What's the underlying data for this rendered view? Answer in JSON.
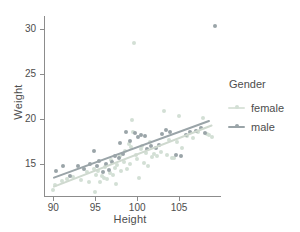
{
  "chart_data": {
    "type": "scatter",
    "title": "",
    "xlabel": "Height",
    "ylabel": "Weight",
    "xlim": [
      89.0,
      110.0
    ],
    "ylim": [
      11.4,
      31.5
    ],
    "xticks": [
      90,
      95,
      100,
      105
    ],
    "yticks": [
      15,
      20,
      25,
      30
    ],
    "xtick_labels": [
      "90",
      "95",
      "100",
      "105"
    ],
    "ytick_labels": [
      "15",
      "20",
      "25",
      "30"
    ],
    "grid": false,
    "legend": {
      "title": "Gender",
      "position": "right",
      "entries": [
        {
          "label": "female",
          "color": "#d3dfd5"
        },
        {
          "label": "male",
          "color": "#9aa4a8"
        }
      ]
    },
    "series": [
      {
        "name": "female",
        "color": "#d3dfd5",
        "fit_line": {
          "x": [
            89.9,
            108.9
          ],
          "y": [
            12.55,
            19.45
          ],
          "color": "#cfd9cf"
        },
        "points": [
          [
            89.9,
            12.1
          ],
          [
            90.2,
            12.6
          ],
          [
            91.0,
            13.1
          ],
          [
            91.6,
            13.3
          ],
          [
            92.4,
            13.5
          ],
          [
            93.3,
            13.2
          ],
          [
            94.0,
            14.1
          ],
          [
            94.3,
            13.0
          ],
          [
            94.8,
            14.4
          ],
          [
            95.0,
            11.9
          ],
          [
            95.1,
            13.8
          ],
          [
            95.3,
            14.2
          ],
          [
            95.6,
            13.0
          ],
          [
            95.8,
            13.6
          ],
          [
            96.0,
            13.4
          ],
          [
            96.2,
            14.6
          ],
          [
            96.4,
            13.3
          ],
          [
            96.7,
            14.0
          ],
          [
            96.9,
            15.4
          ],
          [
            97.1,
            13.7
          ],
          [
            97.3,
            14.5
          ],
          [
            97.5,
            12.7
          ],
          [
            97.6,
            14.9
          ],
          [
            97.9,
            15.9
          ],
          [
            98.1,
            14.2
          ],
          [
            98.4,
            15.2
          ],
          [
            98.6,
            16.4
          ],
          [
            98.8,
            14.4
          ],
          [
            99.0,
            17.2
          ],
          [
            99.2,
            15.0
          ],
          [
            99.3,
            16.9
          ],
          [
            99.4,
            19.9
          ],
          [
            99.5,
            18.5
          ],
          [
            99.6,
            28.5
          ],
          [
            99.8,
            16.0
          ],
          [
            100.0,
            15.5
          ],
          [
            100.2,
            13.4
          ],
          [
            100.4,
            16.6
          ],
          [
            100.6,
            17.0
          ],
          [
            100.8,
            15.1
          ],
          [
            101.0,
            16.2
          ],
          [
            101.3,
            14.8
          ],
          [
            101.5,
            17.4
          ],
          [
            101.8,
            15.7
          ],
          [
            102.0,
            16.1
          ],
          [
            102.4,
            15.9
          ],
          [
            102.8,
            16.3
          ],
          [
            103.2,
            20.9
          ],
          [
            103.5,
            16.0
          ],
          [
            103.8,
            17.6
          ],
          [
            104.1,
            15.6
          ],
          [
            104.4,
            15.6
          ],
          [
            104.7,
            17.4
          ],
          [
            105.0,
            20.3
          ],
          [
            105.4,
            16.8
          ],
          [
            106.0,
            18.1
          ],
          [
            106.6,
            17.9
          ],
          [
            107.2,
            18.6
          ],
          [
            107.8,
            20.1
          ],
          [
            108.3,
            18.3
          ],
          [
            108.6,
            18.2
          ],
          [
            108.9,
            18.0
          ]
        ]
      },
      {
        "name": "male",
        "color": "#9aa4a8",
        "fit_line": {
          "x": [
            89.9,
            108.6
          ],
          "y": [
            13.5,
            19.9
          ],
          "color": "#9aa4a8"
        },
        "points": [
          [
            90.3,
            14.2
          ],
          [
            91.2,
            14.7
          ],
          [
            92.0,
            13.6
          ],
          [
            92.9,
            14.8
          ],
          [
            93.6,
            14.4
          ],
          [
            94.4,
            15.0
          ],
          [
            94.9,
            16.4
          ],
          [
            95.2,
            14.8
          ],
          [
            95.5,
            15.3
          ],
          [
            95.9,
            14.1
          ],
          [
            96.3,
            15.0
          ],
          [
            96.6,
            14.3
          ],
          [
            97.0,
            15.2
          ],
          [
            97.4,
            15.9
          ],
          [
            97.8,
            15.6
          ],
          [
            98.0,
            17.3
          ],
          [
            98.3,
            16.1
          ],
          [
            98.7,
            18.6
          ],
          [
            99.1,
            17.5
          ],
          [
            99.7,
            18.4
          ],
          [
            100.1,
            18.0
          ],
          [
            100.5,
            18.2
          ],
          [
            100.9,
            18.1
          ],
          [
            101.2,
            16.7
          ],
          [
            101.6,
            17.0
          ],
          [
            102.2,
            16.8
          ],
          [
            102.6,
            17.1
          ],
          [
            103.0,
            18.3
          ],
          [
            103.4,
            18.8
          ],
          [
            103.9,
            18.5
          ],
          [
            104.6,
            16.0
          ],
          [
            105.2,
            15.9
          ],
          [
            105.8,
            18.2
          ],
          [
            106.3,
            18.5
          ],
          [
            107.0,
            18.7
          ],
          [
            107.6,
            19.0
          ],
          [
            108.1,
            18.4
          ],
          [
            109.3,
            30.4
          ]
        ]
      }
    ]
  },
  "axes": {
    "y_title": "Weight",
    "x_title": "Height"
  }
}
